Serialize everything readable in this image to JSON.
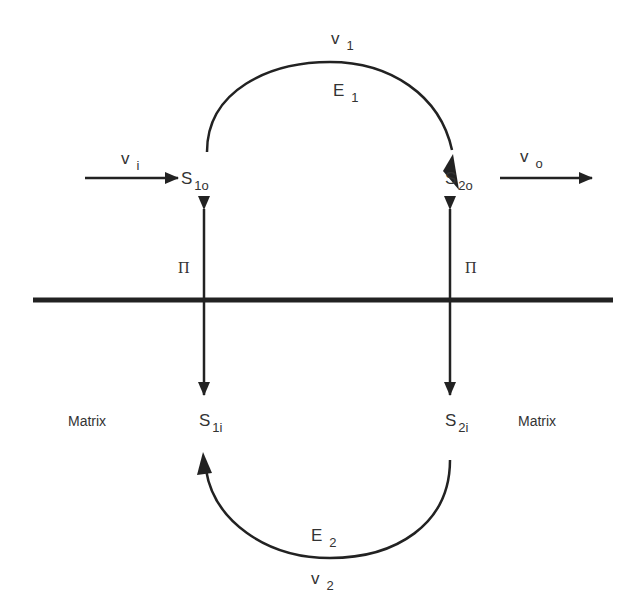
{
  "diagram": {
    "type": "membrane transport cycle",
    "membrane": {
      "label": ""
    },
    "nodes": {
      "s1o": {
        "main": "S",
        "sub": "1o"
      },
      "s2o": {
        "main": "S",
        "sub": "2o"
      },
      "s1i": {
        "main": "S",
        "sub": "1i"
      },
      "s2i": {
        "main": "S",
        "sub": "2i"
      }
    },
    "flux_labels": {
      "vi": {
        "main": "v",
        "sub": "i"
      },
      "vo": {
        "main": "v",
        "sub": "o"
      },
      "v1": {
        "main": "v",
        "sub": "1"
      },
      "v2": {
        "main": "v",
        "sub": "2"
      }
    },
    "enzyme_labels": {
      "e1": {
        "main": "E",
        "sub": "1"
      },
      "e2": {
        "main": "E",
        "sub": "2"
      }
    },
    "partition_labels": {
      "left": "Π",
      "right": "Π"
    },
    "region_labels": {
      "left": "Matrix",
      "right": "Matrix"
    },
    "colors": {
      "stroke": "#222222",
      "text": "#333333",
      "background": "#ffffff"
    }
  }
}
